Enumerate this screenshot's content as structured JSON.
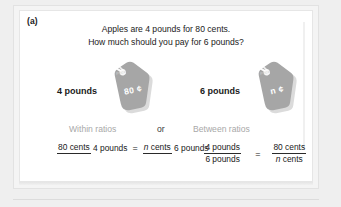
{
  "figure": {
    "part_label": "(a)",
    "prompt_line_1": "Apples are 4 pounds for 80 cents.",
    "prompt_line_2": "How much should you pay for 6 pounds?"
  },
  "tags": [
    {
      "pounds_label": "4 pounds",
      "tag_caption": "Price",
      "tag_value": "80 ¢",
      "tag_color": "#a6a6a6"
    },
    {
      "pounds_label": "6 pounds",
      "tag_caption": "Price",
      "tag_value": "n ¢",
      "tag_color": "#a6a6a6"
    }
  ],
  "ratio_headings": {
    "within": "Within ratios",
    "or": "or",
    "between": "Between ratios"
  },
  "equations": [
    {
      "name": "within-ratios",
      "left_numerator": "80 cents",
      "left_denominator": "4 pounds",
      "equals": "=",
      "right_numerator_italic": "n",
      "right_numerator_rest": " cents",
      "right_denominator": "6 pounds"
    },
    {
      "name": "between-ratios",
      "left_numerator": "4 pounds",
      "left_denominator": "6 pounds",
      "equals": "=",
      "right_numerator": "80 cents",
      "right_denominator_italic": "n",
      "right_denominator_rest": " cents"
    }
  ],
  "colors": {
    "page_background": "#efefef",
    "panel_background": "#ffffff",
    "text": "#212121",
    "muted_text": "#a8a8a8",
    "tag_gray": "#a6a6a6"
  }
}
